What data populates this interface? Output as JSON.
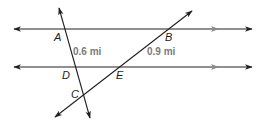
{
  "diagram": {
    "type": "parallel-lines-with-transversals",
    "colors": {
      "line": "#231f20",
      "parallel_marker": "#8a8a8a",
      "measure_text": "#7a7a7a",
      "point_text": "#231f20"
    },
    "points": {
      "A": "A",
      "B": "B",
      "C": "C",
      "D": "D",
      "E": "E"
    },
    "measurements": {
      "AD": "0.6 mi",
      "BE": "0.9 mi"
    },
    "lines": [
      {
        "name": "top-parallel-line",
        "through": [
          "A",
          "B"
        ],
        "parallel_marker": true
      },
      {
        "name": "bottom-parallel-line",
        "through": [
          "D",
          "E"
        ],
        "parallel_marker": true
      },
      {
        "name": "transversal-ADC",
        "through": [
          "A",
          "D",
          "C"
        ]
      },
      {
        "name": "transversal-BEC",
        "through": [
          "B",
          "E",
          "C"
        ]
      }
    ]
  }
}
